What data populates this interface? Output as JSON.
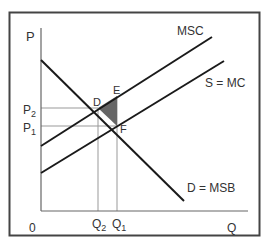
{
  "diagram": {
    "axes": {
      "y_label": "P",
      "x_label": "Q",
      "origin_label": "0"
    },
    "curves": {
      "msc": "MSC",
      "supply": "S = MC",
      "demand": "D = MSB"
    },
    "points": {
      "d": "D",
      "e": "E",
      "f": "F"
    },
    "prices": {
      "p2": "P",
      "p2_sub": "2",
      "p1": "P",
      "p1_sub": "1"
    },
    "quantities": {
      "q2": "Q",
      "q2_sub": "2",
      "q1": "Q",
      "q1_sub": "1"
    },
    "colors": {
      "frame": "#444444",
      "curve": "#1a1a1a",
      "guide": "#999999",
      "deadweight_area": "#666666"
    }
  }
}
